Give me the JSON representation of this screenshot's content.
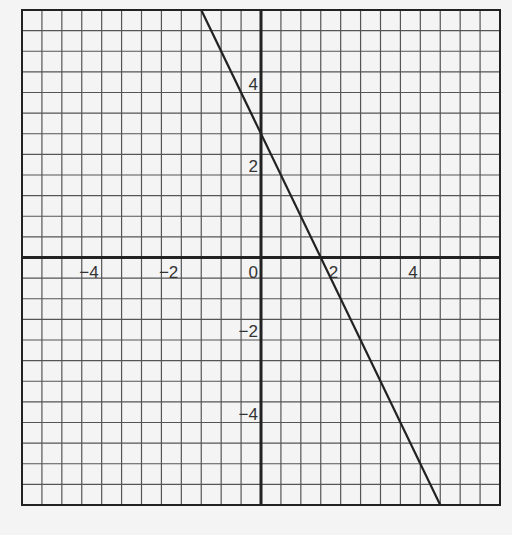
{
  "chart_data": {
    "type": "line",
    "title": "",
    "xlabel": "",
    "ylabel": "",
    "xlim": [
      -6,
      6
    ],
    "ylim": [
      -6,
      6
    ],
    "grid": true,
    "grid_step": 0.5,
    "x_ticks": [
      -4,
      -2,
      0,
      2,
      4
    ],
    "y_ticks": [
      4,
      2,
      -2,
      -4
    ],
    "x_tick_labels": [
      "−4",
      "−2",
      "0",
      "2",
      "4"
    ],
    "y_tick_labels": [
      "4",
      "2",
      "−2",
      "−4"
    ],
    "series": [
      {
        "name": "y = -2x + 3",
        "slope": -2,
        "intercept": 3,
        "x": [
          -1.5,
          4.5
        ],
        "y": [
          6,
          -6
        ]
      }
    ],
    "legend": null
  },
  "colors": {
    "background": "#f4f4f4",
    "grid": "#555555",
    "axis": "#222222",
    "line": "#222222"
  }
}
